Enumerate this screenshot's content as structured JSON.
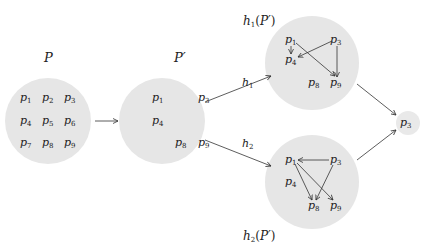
{
  "colors": {
    "circle_fill": "#e6e6e6",
    "stroke": "#333333",
    "text": "#222222",
    "background": "#ffffff"
  },
  "sets": {
    "P": {
      "label": "P",
      "elements": [
        "p1",
        "p2",
        "p3",
        "p4",
        "p5",
        "p6",
        "p7",
        "p8",
        "p9"
      ]
    },
    "P_prime": {
      "label": "P′",
      "elements": [
        "p1",
        "p3",
        "p4",
        "p8",
        "p9"
      ]
    },
    "h1_P_prime": {
      "label": "h1(P′)",
      "elements": [
        "p1",
        "p3",
        "p4",
        "p8",
        "p9"
      ],
      "edges": [
        [
          "p1",
          "p4"
        ],
        [
          "p1",
          "p9"
        ],
        [
          "p3",
          "p4"
        ],
        [
          "p3",
          "p9"
        ]
      ]
    },
    "h2_P_prime": {
      "label": "h2(P′)",
      "elements": [
        "p1",
        "p3",
        "p4",
        "p8",
        "p9"
      ],
      "edges": [
        [
          "p3",
          "p1"
        ],
        [
          "p1",
          "p8"
        ],
        [
          "p1",
          "p9"
        ],
        [
          "p3",
          "p8"
        ]
      ]
    },
    "result": {
      "label": "",
      "elements": [
        "p3"
      ]
    }
  },
  "arrows": [
    {
      "from": "P",
      "to": "P_prime",
      "label": ""
    },
    {
      "from": "P_prime",
      "to": "h1_P_prime",
      "label": "h1"
    },
    {
      "from": "P_prime",
      "to": "h2_P_prime",
      "label": "h2"
    },
    {
      "from": "h1_P_prime",
      "to": "result",
      "label": ""
    },
    {
      "from": "h2_P_prime",
      "to": "result",
      "label": ""
    }
  ]
}
